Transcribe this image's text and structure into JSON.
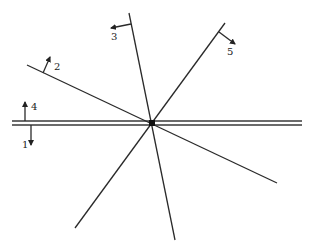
{
  "diagram": {
    "type": "force-line-intersection",
    "center": {
      "x": 152,
      "y": 123
    },
    "horizontal_member": {
      "y_top": 121,
      "y_bottom": 125,
      "x_start": 12,
      "x_end": 302
    },
    "lines": [
      {
        "id": "line-2",
        "from": [
          27,
          65
        ],
        "to": [
          277,
          183
        ]
      },
      {
        "id": "line-3",
        "from": [
          129,
          13
        ],
        "to": [
          175,
          240
        ]
      },
      {
        "id": "line-5",
        "from": [
          225,
          23
        ],
        "to": [
          75,
          228
        ]
      }
    ],
    "labels": [
      {
        "id": "1",
        "text": "1",
        "x": 22,
        "y": 145,
        "direction": "down"
      },
      {
        "id": "2",
        "text": "2",
        "x": 53,
        "y": 68,
        "direction": "perpendicular-up-left"
      },
      {
        "id": "3",
        "text": "3",
        "x": 111,
        "y": 39,
        "direction": "left"
      },
      {
        "id": "4",
        "text": "4",
        "x": 31,
        "y": 109,
        "direction": "up"
      },
      {
        "id": "5",
        "text": "5",
        "x": 227,
        "y": 52,
        "direction": "down-right"
      }
    ],
    "colors": {
      "line": "#2a2a2a",
      "background": "#ffffff"
    }
  }
}
